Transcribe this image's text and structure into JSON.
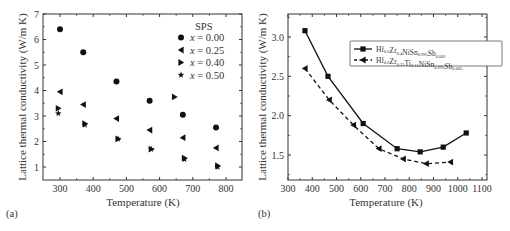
{
  "chart_data": [
    {
      "type": "scatter",
      "panel_label": "(a)",
      "title": "",
      "xlabel": "Temperature (K)",
      "ylabel": "Lattice thermal conductivity (W/m K)",
      "xlim": [
        250,
        850
      ],
      "ylim": [
        0.5,
        7
      ],
      "xticks": [
        300,
        400,
        500,
        600,
        700,
        800
      ],
      "yticks": [
        1,
        2,
        3,
        4,
        5,
        6,
        7
      ],
      "grid": false,
      "legend_title": "SPS",
      "legend_position": "upper right",
      "series": [
        {
          "name": "x = 0.00",
          "marker": "circle",
          "x": [
            300,
            370,
            470,
            570,
            670,
            770
          ],
          "y": [
            6.4,
            5.5,
            4.35,
            3.6,
            3.05,
            2.55
          ]
        },
        {
          "name": "x = 0.25",
          "marker": "triangle-left",
          "x": [
            300,
            370,
            470,
            570,
            670,
            770
          ],
          "y": [
            3.95,
            3.45,
            2.9,
            2.45,
            2.15,
            1.75
          ]
        },
        {
          "name": "x = 0.40",
          "marker": "triangle-right",
          "x": [
            295,
            375,
            475,
            575,
            675,
            775,
            645
          ],
          "y": [
            3.3,
            2.7,
            2.1,
            1.7,
            1.35,
            1.05,
            3.75
          ]
        },
        {
          "name": "x = 0.50",
          "marker": "star",
          "x": [
            295,
            375,
            475,
            575,
            675,
            775
          ],
          "y": [
            3.1,
            2.65,
            2.1,
            1.7,
            1.3,
            1.0
          ]
        }
      ]
    },
    {
      "type": "line",
      "panel_label": "(b)",
      "title": "",
      "xlabel": "Temperature (K)",
      "ylabel": "Lattice thermal conductivity (W/m K)",
      "xlim": [
        300,
        1100
      ],
      "ylim": [
        1.2,
        3.3
      ],
      "xticks": [
        300,
        400,
        500,
        600,
        700,
        800,
        900,
        1000,
        1100
      ],
      "yticks": [
        1.5,
        2.0,
        2.5,
        3.0
      ],
      "ytick_labels": [
        "1.5",
        "2.0",
        "2.5",
        "3.0"
      ],
      "grid": false,
      "legend_position": "upper right",
      "series": [
        {
          "name": "Hf0.6Zr0.4NiSn0.995Sb0.005",
          "formula_parts": [
            [
              "Hf",
              ""
            ],
            [
              "",
              "0.6"
            ],
            [
              "Zr",
              ""
            ],
            [
              "",
              "0.4"
            ],
            [
              "NiSn",
              ""
            ],
            [
              "",
              "0.995"
            ],
            [
              "Sb",
              ""
            ],
            [
              "",
              "0.005"
            ]
          ],
          "marker": "square",
          "line": "solid",
          "x": [
            370,
            465,
            610,
            750,
            845,
            940,
            1035
          ],
          "y": [
            3.08,
            2.5,
            1.9,
            1.58,
            1.54,
            1.6,
            1.78
          ]
        },
        {
          "name": "Hf0.6Zr0.25Ti0.15NiSn0.995Sb0.005",
          "formula_parts": [
            [
              "Hf",
              ""
            ],
            [
              "",
              "0.6"
            ],
            [
              "Zr",
              ""
            ],
            [
              "",
              "0.25"
            ],
            [
              "Ti",
              ""
            ],
            [
              "",
              "0.15"
            ],
            [
              "NiSn",
              ""
            ],
            [
              "",
              "0.995"
            ],
            [
              "Sb",
              ""
            ],
            [
              "",
              "0.005"
            ]
          ],
          "marker": "triangle-left",
          "line": "dashed",
          "x": [
            370,
            470,
            570,
            675,
            775,
            870,
            970
          ],
          "y": [
            2.6,
            2.2,
            1.88,
            1.58,
            1.45,
            1.39,
            1.41
          ]
        }
      ]
    }
  ],
  "panels": {
    "a": {
      "label": "(a)",
      "xlabel": "Temperature (K)",
      "ylabel": "Lattice thermal conductivity (W/m K)",
      "legend_title": "SPS",
      "legend": [
        "x = 0.00",
        "x = 0.25",
        "x = 0.40",
        "x = 0.50"
      ],
      "xtick_labels": [
        "300",
        "400",
        "500",
        "600",
        "700",
        "800"
      ],
      "ytick_labels": [
        "1",
        "2",
        "3",
        "4",
        "5",
        "6",
        "7"
      ]
    },
    "b": {
      "label": "(b)",
      "xlabel": "Temperature (K)",
      "ylabel": "Lattice thermal conductivity (W/m K)",
      "xtick_labels": [
        "300",
        "400",
        "500",
        "600",
        "700",
        "800",
        "900",
        "1000",
        "1100"
      ],
      "ytick_labels": [
        "1.5",
        "2.0",
        "2.5",
        "3.0"
      ]
    }
  },
  "colors": {
    "ink": "#111111",
    "axis": "#333333",
    "background": "#ffffff"
  }
}
